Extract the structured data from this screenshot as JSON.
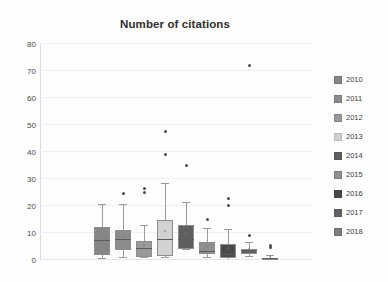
{
  "chart_data": {
    "type": "box",
    "title": "Number of citations",
    "xlabel": "",
    "ylabel": "",
    "ylim": [
      0,
      80
    ],
    "yticks": [
      0,
      10,
      20,
      30,
      40,
      50,
      60,
      70,
      80
    ],
    "grid": true,
    "legend_position": "right",
    "categories": [
      "2010",
      "2011",
      "2012",
      "2013",
      "2014",
      "2015",
      "2016",
      "2017",
      "2018"
    ],
    "series": [
      {
        "name": "2010",
        "color": "#868686",
        "whisker_low": 0.5,
        "q1": 2.0,
        "median": 7.0,
        "q3": 12.2,
        "whisker_high": 20.5,
        "mean": 7.4,
        "outliers": []
      },
      {
        "name": "2011",
        "color": "#8c8c8c",
        "whisker_low": 0.8,
        "q1": 3.6,
        "median": 7.4,
        "q3": 11.2,
        "whisker_high": 20.3,
        "mean": 7.9,
        "outliers": [
          24.0
        ]
      },
      {
        "name": "2012",
        "color": "#9a9a9a",
        "whisker_low": 0.6,
        "q1": 1.2,
        "median": 4.0,
        "q3": 7.1,
        "whisker_high": 12.6,
        "mean": 4.9,
        "outliers": [
          24.3,
          26.0
        ]
      },
      {
        "name": "2013",
        "color": "#d2d2d2",
        "whisker_low": 0.8,
        "q1": 1.4,
        "median": 7.3,
        "q3": 15.0,
        "whisker_high": 28.2,
        "mean": 10.1,
        "outliers": [
          38.5,
          47.2
        ]
      },
      {
        "name": "2014",
        "color": "#5f5f5f",
        "whisker_low": 3.6,
        "q1": 4.1,
        "median": 7.4,
        "q3": 13.0,
        "whisker_high": 21.2,
        "mean": 9.2,
        "outliers": [
          34.6
        ]
      },
      {
        "name": "2015",
        "color": "#8f8f8f",
        "whisker_low": 0.9,
        "q1": 2.2,
        "median": 3.0,
        "q3": 6.6,
        "whisker_high": 11.5,
        "mean": 4.6,
        "outliers": [
          14.6
        ]
      },
      {
        "name": "2016",
        "color": "#4a4a4a",
        "whisker_low": 0.6,
        "q1": 0.9,
        "median": 2.0,
        "q3": 5.8,
        "whisker_high": 11.2,
        "mean": 3.6,
        "outliers": [
          19.6,
          22.4
        ]
      },
      {
        "name": "2017",
        "color": "#636363",
        "whisker_low": 1.0,
        "q1": 2.3,
        "median": 3.2,
        "q3": 3.9,
        "whisker_high": 6.3,
        "mean": 3.4,
        "outliers": [
          8.7,
          71.5
        ]
      },
      {
        "name": "2018",
        "color": "#7d7d7d",
        "whisker_low": 0.0,
        "q1": 0.0,
        "median": 0.4,
        "q3": 0.9,
        "whisker_high": 1.4,
        "mean": 0.7,
        "outliers": [
          4.0,
          4.8
        ]
      }
    ]
  },
  "legend": {
    "items": [
      {
        "label": "2010",
        "color": "#868686"
      },
      {
        "label": "2011",
        "color": "#8c8c8c"
      },
      {
        "label": "2012",
        "color": "#9a9a9a"
      },
      {
        "label": "2013",
        "color": "#d2d2d2"
      },
      {
        "label": "2014",
        "color": "#5f5f5f"
      },
      {
        "label": "2015",
        "color": "#8f8f8f"
      },
      {
        "label": "2016",
        "color": "#4a4a4a"
      },
      {
        "label": "2017",
        "color": "#636363"
      },
      {
        "label": "2018",
        "color": "#7d7d7d"
      }
    ]
  }
}
